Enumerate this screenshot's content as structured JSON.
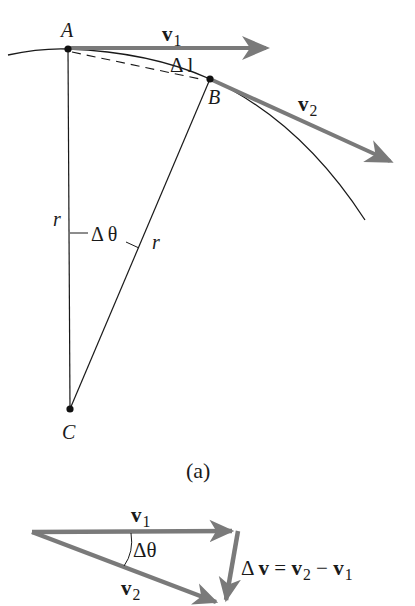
{
  "figure_a": {
    "points": {
      "A": "A",
      "B": "B",
      "C": "C"
    },
    "v1_label": "v",
    "v1_sub": "1",
    "v2_label": "v",
    "v2_sub": "2",
    "arc_label": "Δ l",
    "radius_left": "r",
    "radius_right": "r",
    "angle_label": "Δ θ",
    "caption": "(a)"
  },
  "figure_b": {
    "v1_label": "v",
    "v1_sub": "1",
    "v2_label": "v",
    "v2_sub": "2",
    "angle_label": "Δθ",
    "delta_v": {
      "prefix": "Δ ",
      "v": "v",
      "eq": " = ",
      "v2": "v",
      "v2_sub": "2",
      "minus": " − ",
      "v1": "v",
      "v1_sub": "1"
    }
  },
  "colors": {
    "vector": "#7a7a7a",
    "line": "#1a1a1a"
  }
}
